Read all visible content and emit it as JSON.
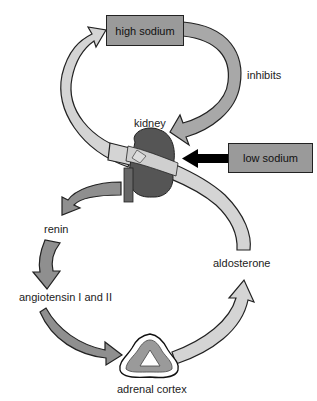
{
  "diagram": {
    "nodes": {
      "high_sodium": "high sodium",
      "low_sodium": "low sodium",
      "kidney": "kidney",
      "renin": "renin",
      "angiotensin": "angiotensin I and II",
      "adrenal_cortex": "adrenal cortex",
      "aldosterone": "aldosterone"
    },
    "edge_labels": {
      "inhibits": "inhibits"
    },
    "edges": [
      {
        "from": "high sodium",
        "to": "kidney",
        "label": "inhibits"
      },
      {
        "from": "low sodium",
        "to": "kidney",
        "label": ""
      },
      {
        "from": "kidney",
        "to": "renin",
        "label": ""
      },
      {
        "from": "renin",
        "to": "angiotensin I and II",
        "label": ""
      },
      {
        "from": "angiotensin I and II",
        "to": "adrenal cortex",
        "label": ""
      },
      {
        "from": "adrenal cortex",
        "to": "aldosterone",
        "label": ""
      },
      {
        "from": "aldosterone",
        "to": "high sodium",
        "label": "",
        "via": "kidney"
      }
    ],
    "colors": {
      "box_fill": "#9a9a9a",
      "light_arrow": "#d4d4d4",
      "mid_arrow": "#a8a8a8",
      "dark_arrow": "#8a8a8a",
      "kidney": "#555555",
      "black_arrow": "#000000"
    }
  }
}
